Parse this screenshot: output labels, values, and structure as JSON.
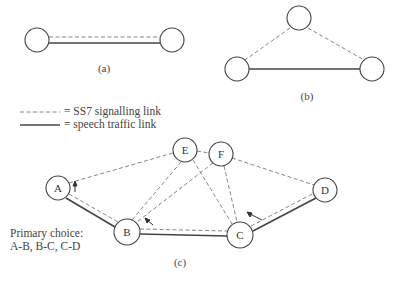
{
  "diagrams": {
    "a": {
      "caption": "(a)"
    },
    "b": {
      "caption": "(b)"
    },
    "c": {
      "caption": "(c)",
      "nodes": {
        "A": "A",
        "B": "B",
        "C": "C",
        "D": "D",
        "E": "E",
        "F": "F"
      },
      "primary_choice_title": "Primary choice:",
      "primary_choice_value": "A-B, B-C, C-D"
    }
  },
  "legend": {
    "signalling": "= SS7 signalling link",
    "speech": "= speech traffic link"
  },
  "colors": {
    "stroke": "#444444",
    "dash": "#777777",
    "background": "#ffffff"
  }
}
